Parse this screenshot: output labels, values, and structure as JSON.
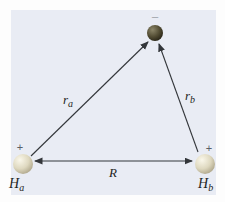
{
  "figure": {
    "colors": {
      "panel_background": "#e9ecf4",
      "page_background": "#fdfdfd",
      "line": "#33363a",
      "label_text": "#1d1f23",
      "plus_sign": "#5a5f66",
      "minus_sign": "#a9adb3",
      "nucleus_body": "#ded8bf",
      "nucleus_highlight": "#faf7ea",
      "nucleus_edge": "#a89f83",
      "electron_body": "#524c33",
      "electron_highlight": "#8c8669",
      "electron_edge": "#211e12"
    },
    "electron": {
      "sign": "−"
    },
    "nucleus_a": {
      "sign": "+",
      "label_main": "H",
      "label_sub": "a"
    },
    "nucleus_b": {
      "sign": "+",
      "label_main": "H",
      "label_sub": "b"
    },
    "distance_a": {
      "label_main": "r",
      "label_sub": "a"
    },
    "distance_b": {
      "label_main": "r",
      "label_sub": "b"
    },
    "separation": {
      "label": "R"
    }
  }
}
